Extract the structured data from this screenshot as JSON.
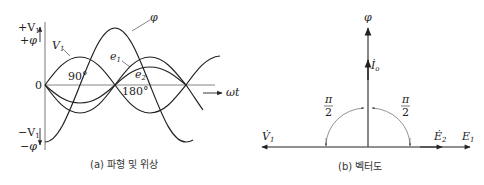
{
  "left_panel": {
    "caption": "(a) 파형 및 위상",
    "y_axis_top": [
      "+V",
      "1",
      "+φ"
    ],
    "y_axis_bottom": [
      "−V",
      "1",
      "−φ"
    ],
    "origin": "0",
    "x_axis_label": "ωt",
    "angle_90": "90°",
    "angle_180": "180°",
    "curves": [
      {
        "name": "phi",
        "label": "φ"
      },
      {
        "name": "V1",
        "label": "V",
        "sub": "1"
      },
      {
        "name": "e1",
        "label": "e",
        "sub": "1"
      },
      {
        "name": "e2",
        "label": "e",
        "sub": "2"
      }
    ]
  },
  "right_panel": {
    "caption": "(b) 벡터도",
    "phi_label": "φ",
    "io_label": "İ",
    "io_sub": "o",
    "v1_label": "V̇",
    "v1_sub": "1",
    "e2_label": "Ė",
    "e2_sub": "2",
    "e1_label": "E",
    "e1_sub": "1",
    "angle_left": {
      "num": "π",
      "den": "2"
    },
    "angle_right": {
      "num": "π",
      "den": "2"
    }
  },
  "colors": {
    "line": "#222222",
    "axis": "#555555",
    "arc": "#666666"
  }
}
